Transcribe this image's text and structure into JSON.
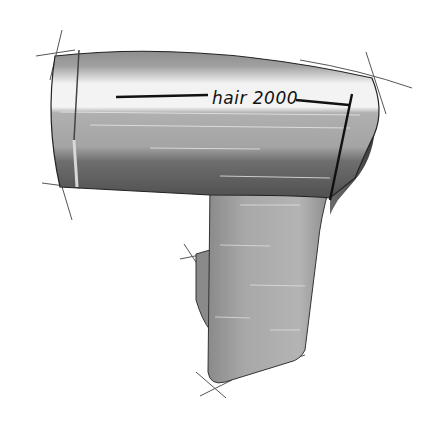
{
  "illustration": {
    "subject": "hair dryer marker sketch",
    "brand_label": "hair 2000",
    "colors": {
      "background": "#ffffff",
      "body_light": "#c8c8c8",
      "body_mid": "#9a9a9a",
      "body_dark": "#5a5a5a",
      "highlight": "#f4f4f4",
      "outline": "#222222",
      "construction_lines": "#555555"
    }
  }
}
